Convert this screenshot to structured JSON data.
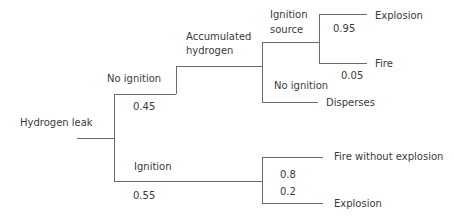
{
  "diagram": {
    "type": "event-tree",
    "line_color": "#6b6b6b",
    "root": {
      "label": "Hydrogen leak"
    },
    "branches": {
      "no_ignition": {
        "label": "No ignition",
        "probability": "0.45"
      },
      "accumulated_hydrogen": {
        "label_line1": "Accumulated",
        "label_line2": "hydrogen"
      },
      "ignition_source": {
        "label_line1": "Ignition",
        "label_line2": "source"
      },
      "explosion_upper": {
        "label": "Explosion",
        "probability": "0.95"
      },
      "fire_upper": {
        "label": "Fire",
        "probability": "0.05"
      },
      "no_ignition_late": {
        "label": "No ignition"
      },
      "disperses": {
        "label": "Disperses"
      },
      "ignition": {
        "label": "Ignition",
        "probability": "0.55"
      },
      "fire_without_explosion": {
        "label": "Fire without explosion",
        "probability": "0.8"
      },
      "explosion_lower": {
        "label": "Explosion",
        "probability": "0.2"
      }
    }
  }
}
